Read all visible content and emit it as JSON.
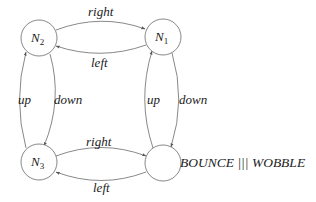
{
  "diagram": {
    "type": "state-transition-graph",
    "nodes": [
      {
        "id": "N2",
        "label_main": "N",
        "label_sub": "2",
        "cx": 39,
        "cy": 38
      },
      {
        "id": "N1",
        "label_main": "N",
        "label_sub": "1",
        "cx": 163,
        "cy": 37
      },
      {
        "id": "N3",
        "label_main": "N",
        "label_sub": "3",
        "cx": 39,
        "cy": 162
      },
      {
        "id": "start",
        "label_main": "",
        "label_sub": "",
        "cx": 163,
        "cy": 163
      }
    ],
    "edges": [
      {
        "from": "N2",
        "to": "N1",
        "label": "right"
      },
      {
        "from": "N1",
        "to": "N2",
        "label": "left"
      },
      {
        "from": "N3",
        "to": "N2",
        "label": "up"
      },
      {
        "from": "N2",
        "to": "N3",
        "label": "down"
      },
      {
        "from": "start",
        "to": "N1",
        "label": "up"
      },
      {
        "from": "N1",
        "to": "start",
        "label": "down"
      },
      {
        "from": "N3",
        "to": "start",
        "label": "right"
      },
      {
        "from": "start",
        "to": "N3",
        "label": "left"
      }
    ],
    "process_label": "BOUNCE ||| WOBBLE",
    "colors": {
      "stroke": "#6a6a6a",
      "text": "#222222",
      "background": "#ffffff"
    }
  }
}
